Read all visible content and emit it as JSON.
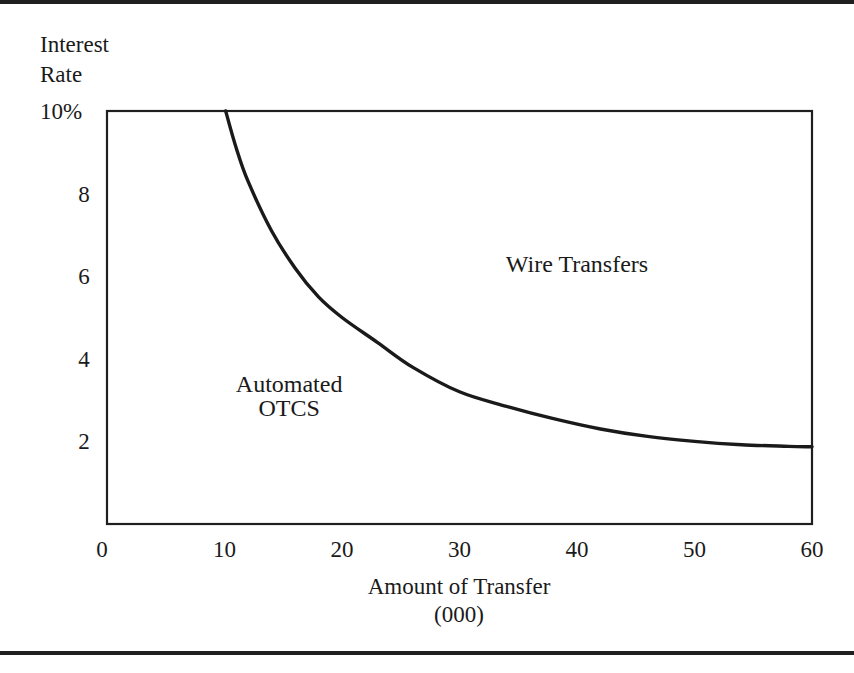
{
  "chart_data": {
    "type": "line",
    "title": "",
    "ylabel_lines": [
      "Interest",
      "Rate"
    ],
    "xlabel_lines": [
      "Amount of Transfer",
      "(000)"
    ],
    "xlim": [
      0,
      60
    ],
    "ylim": [
      0,
      10
    ],
    "x_ticks": [
      0,
      10,
      20,
      30,
      40,
      50,
      60
    ],
    "x_tick_labels": [
      "0",
      "10",
      "20",
      "30",
      "40",
      "50",
      "60"
    ],
    "y_ticks": [
      2,
      4,
      6,
      8,
      10
    ],
    "y_tick_labels": [
      "2",
      "4",
      "6",
      "8",
      "10%"
    ],
    "grid": false,
    "series": [
      {
        "name": "Indifference boundary (Wire Transfers vs Automated OTCS)",
        "x": [
          10.1,
          11,
          12,
          14,
          16,
          18,
          20,
          23,
          26,
          30,
          34,
          38,
          42,
          46,
          50,
          54,
          58,
          60
        ],
        "y": [
          10.0,
          9.1,
          8.3,
          7.1,
          6.2,
          5.5,
          5.0,
          4.4,
          3.8,
          3.2,
          2.85,
          2.55,
          2.3,
          2.12,
          2.0,
          1.92,
          1.88,
          1.87
        ]
      }
    ],
    "annotations": [
      {
        "text": "Wire Transfers",
        "x": 40,
        "y": 6.3
      },
      {
        "text": "Automated",
        "x": 15.5,
        "y": 3.4
      },
      {
        "text": "OTCS",
        "x": 15.5,
        "y": 2.8
      }
    ],
    "legend": null
  }
}
